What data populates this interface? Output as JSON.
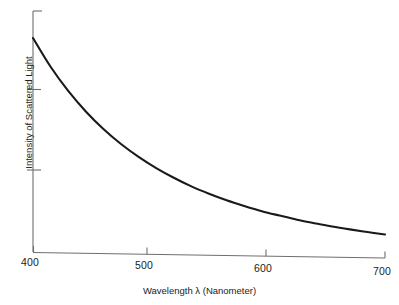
{
  "chart_data": {
    "type": "line",
    "title": "",
    "xlabel": "Wavelength λ (Nanometer)",
    "ylabel": "Intensity of Scattered Light",
    "xlim": [
      400,
      700
    ],
    "ylim": [
      0,
      1
    ],
    "grid": false,
    "legend": "none",
    "xticks": [
      400,
      500,
      600,
      700
    ],
    "xtick_labels": [
      "400",
      "500",
      "600",
      "700"
    ],
    "yticks": [
      0.28,
      0.62,
      1.0
    ],
    "ytick_labels": [
      "",
      "",
      ""
    ],
    "series": [
      {
        "name": "Scattered intensity",
        "color": "#1a1a1a",
        "x": [
          400,
          415,
          430,
          445,
          460,
          475,
          490,
          505,
          520,
          535,
          550,
          565,
          580,
          595,
          610,
          625,
          640,
          655,
          670,
          685,
          700
        ],
        "y": [
          1.0,
          0.866,
          0.754,
          0.659,
          0.578,
          0.509,
          0.45,
          0.399,
          0.355,
          0.316,
          0.283,
          0.254,
          0.229,
          0.206,
          0.187,
          0.169,
          0.154,
          0.14,
          0.128,
          0.117,
          0.107
        ]
      }
    ],
    "annotations": []
  },
  "axes": {
    "x_tick_labels": [
      "400",
      "500",
      "600",
      "700"
    ],
    "x_axis_title": "Wavelength λ (Nanometer)",
    "y_axis_title": "Intensity of Scattered Light"
  },
  "colors": {
    "background": "#ffffff",
    "curve": "#1a1a1a",
    "axis": "#6e6e6e",
    "text": "#222222"
  }
}
